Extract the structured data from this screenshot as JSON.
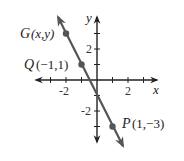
{
  "figure": {
    "type": "coordinate-plane-line",
    "colors": {
      "axes": "#222222",
      "line": "#555555",
      "points": "#555555",
      "text": "#222222"
    },
    "axes": {
      "x_label": "x",
      "y_label": "y",
      "x_ticks": [
        -3,
        -2,
        -1,
        1,
        2,
        3
      ],
      "y_ticks": [
        3,
        2,
        1,
        -1,
        -2,
        -3
      ],
      "x_tick_labels": [
        {
          "value": -2,
          "text": "-2"
        },
        {
          "value": 2,
          "text": "2"
        }
      ],
      "y_tick_labels": [
        {
          "value": 2,
          "text": "2"
        },
        {
          "value": -2,
          "text": "-2"
        }
      ]
    },
    "points": [
      {
        "name": "G",
        "coords_text": "(x,y)",
        "label": "G (x,y)"
      },
      {
        "name": "Q",
        "coords_text": "(−1,1)",
        "label": "Q(−1,1)",
        "x": -1,
        "y": 1
      },
      {
        "name": "P",
        "coords_text": "(1,−3)",
        "label": "P(1,−3)",
        "x": 1,
        "y": -3
      }
    ],
    "line": {
      "slope": -2,
      "y_intercept": -1,
      "through": [
        "Q",
        "P",
        "G"
      ]
    }
  },
  "labels": {
    "g_letter": "G",
    "g_coords": "(x,y)",
    "q_letter": "Q",
    "q_coords": "(−1,1)",
    "p_letter": "P",
    "p_coords": "(1,−3)",
    "x_axis": "x",
    "y_axis": "y",
    "x_tick_neg2": "-2",
    "x_tick_2": "2",
    "y_tick_2": "2",
    "y_tick_neg2": "-2"
  }
}
